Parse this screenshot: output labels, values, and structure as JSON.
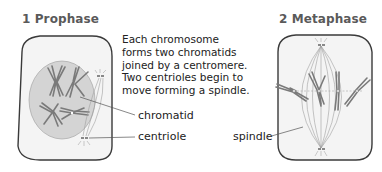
{
  "panels": [
    {
      "number": "1",
      "title": "1  Prophase",
      "description": "Each chromosome\nforms two chromatids\njoined by a centromere.\nTwo centrioles begin to\nmove forming a spindle.",
      "labels": {
        "chromatid": "chromatid",
        "centriole": "centriole"
      }
    },
    {
      "number": "2",
      "title": "2  Metaphase",
      "labels": {
        "spindle": "spindle"
      }
    }
  ],
  "colors": {
    "cell_fill": "#f4f4f4",
    "cell_outline": "#3a3a3a",
    "nucleus_fill": "#d4d4d4",
    "chromosome": "#7a7a7a",
    "spindle": "#9a9a9a",
    "title_text": "#5a5a5a"
  }
}
